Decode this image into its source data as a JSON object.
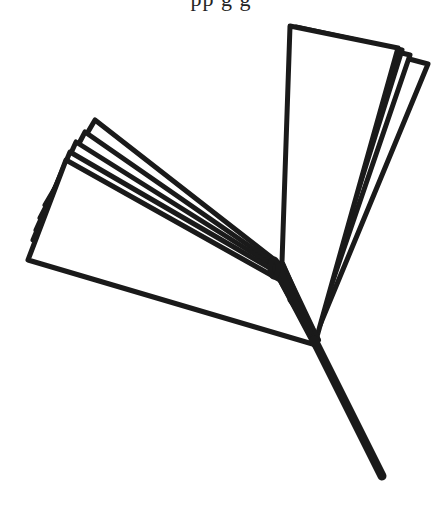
{
  "image": {
    "description": "Line drawing of fanned-out sheets (two bundles) joined at a single stem, resembling a ginkgo leaf / fan of papers",
    "top_text_fragment": "pp         g g",
    "stroke_color": "#1a1a1a",
    "background": "#ffffff"
  },
  "shapes": {
    "left_fan_sheets": 5,
    "right_fan_sheets": 4,
    "stem": {
      "x1": 316,
      "y1": 345,
      "x2": 382,
      "y2": 476
    }
  }
}
